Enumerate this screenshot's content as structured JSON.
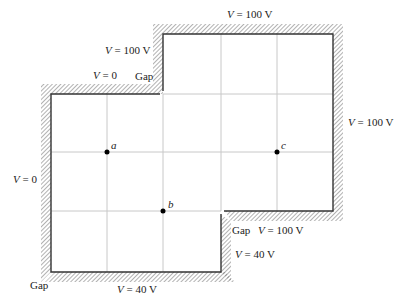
{
  "diagram": {
    "type": "electrostatic-boundary-grid",
    "labels": {
      "top_right": {
        "var": "V",
        "eq": " = 100 V"
      },
      "upper_step": {
        "var": "V",
        "eq": " = 100 V"
      },
      "top_left": {
        "var": "V",
        "eq": " = 0"
      },
      "gap_top": "Gap",
      "right": {
        "var": "V",
        "eq": " = 100 V"
      },
      "left": {
        "var": "V",
        "eq": " = 0"
      },
      "gap_bottom_right": "Gap",
      "bottom_right_upper": {
        "var": "V",
        "eq": " = 100 V"
      },
      "bottom_right_lower": {
        "var": "V",
        "eq": " = 40 V"
      },
      "gap_bottom_left": "Gap",
      "bottom": {
        "var": "V",
        "eq": " = 40 V"
      }
    },
    "points": [
      {
        "name": "a"
      },
      {
        "name": "b"
      },
      {
        "name": "c"
      }
    ],
    "colors": {
      "boundary": "#333333",
      "hatch": "#555555",
      "grid": "#c8c8c8",
      "point": "#000000"
    }
  }
}
